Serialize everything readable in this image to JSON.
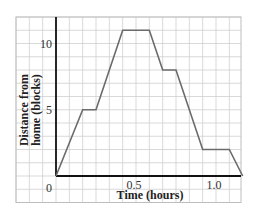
{
  "chart_data": {
    "type": "line",
    "title": "",
    "xlabel": "Time (hours)",
    "ylabel_lines": [
      "Distance from",
      "home (blocks)"
    ],
    "ylabel": "Distance from home (blocks)",
    "xlim": [
      0,
      1.1667
    ],
    "ylim": [
      0,
      12
    ],
    "grid": true,
    "grid_x_step": 0.08333,
    "grid_y_step": 1,
    "x_ticks": [
      {
        "value": 0.5,
        "label": "0.5"
      },
      {
        "value": 1.0,
        "label": "1.0"
      }
    ],
    "y_ticks": [
      {
        "value": 5,
        "label": "5"
      },
      {
        "value": 10,
        "label": "10"
      }
    ],
    "origin_label": "0",
    "series": [
      {
        "name": "distance",
        "color": "#6b6b6b",
        "x": [
          0,
          0.1667,
          0.25,
          0.4167,
          0.5833,
          0.6667,
          0.75,
          0.9167,
          1.0833,
          1.1667
        ],
        "y": [
          0,
          5,
          5,
          11,
          11,
          8,
          8,
          2,
          2,
          0
        ]
      }
    ]
  },
  "colors": {
    "grid": "#cfcfcf",
    "axis": "#111111",
    "line": "#6b6b6b",
    "border": "#bdbdbd"
  }
}
